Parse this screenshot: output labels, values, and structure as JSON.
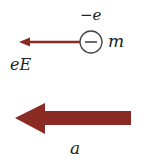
{
  "diagram": {
    "charge_label": "−e",
    "mass_label": "m",
    "force_label": "eE",
    "acceleration_label": "a",
    "colors": {
      "arrow": "#8b2a22",
      "circle_stroke": "#444444",
      "text": "#222222"
    }
  }
}
